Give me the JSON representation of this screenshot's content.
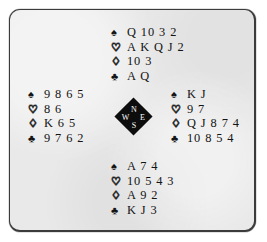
{
  "board": {
    "name": "bridge-deal-diagram",
    "background_color": "#e9e9e9",
    "border_color": "#3b3b3b"
  },
  "suits": {
    "spade": {
      "glyph": "♠",
      "filled": true,
      "name": "spade-symbol"
    },
    "heart": {
      "glyph": "♡",
      "filled": false,
      "name": "heart-symbol"
    },
    "diamond": {
      "glyph": "♢",
      "filled": false,
      "name": "diamond-symbol"
    },
    "club": {
      "glyph": "♣",
      "filled": true,
      "name": "club-symbol"
    }
  },
  "compass": {
    "north": "N",
    "west": "W",
    "east": "E",
    "south": "S",
    "fill_color": "#0d0d0d",
    "text_color": "#ffffff"
  },
  "hands": {
    "north": {
      "label": "North",
      "spades": "Q 10 3 2",
      "hearts": "A K Q J 2",
      "diamonds": "10 3",
      "clubs": "A Q"
    },
    "west": {
      "label": "West",
      "spades": "9 8 6 5",
      "hearts": "8 6",
      "diamonds": "K 6 5",
      "clubs": "9 7 6 2"
    },
    "east": {
      "label": "East",
      "spades": "K J",
      "hearts": "9 7",
      "diamonds": "Q J 8 7 4",
      "clubs": "10 8 5 4"
    },
    "south": {
      "label": "South",
      "spades": "A 7 4",
      "hearts": "10 5 4 3",
      "diamonds": "A 9 2",
      "clubs": "K J 3"
    }
  }
}
